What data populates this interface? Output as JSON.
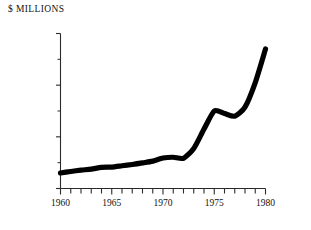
{
  "chart_data": {
    "type": "line",
    "title": "$ MILLIONS",
    "xlabel": "",
    "ylabel": "$ MILLIONS",
    "xlim": [
      1960,
      1980
    ],
    "ylim": [
      0,
      60000
    ],
    "grid": false,
    "legend": null,
    "x": [
      1960,
      1961,
      1962,
      1963,
      1964,
      1965,
      1966,
      1967,
      1968,
      1969,
      1970,
      1971,
      1972,
      1973,
      1974,
      1975,
      1976,
      1977,
      1978,
      1979,
      1980
    ],
    "values": [
      6000,
      6600,
      7100,
      7500,
      8200,
      8300,
      8800,
      9300,
      9900,
      10600,
      11800,
      12100,
      11700,
      15500,
      23000,
      30000,
      29000,
      28000,
      31500,
      41000,
      54000
    ],
    "series": [
      {
        "name": "value",
        "values": [
          6000,
          6600,
          7100,
          7500,
          8200,
          8300,
          8800,
          9300,
          9900,
          10600,
          11800,
          12100,
          11700,
          15500,
          23000,
          30000,
          29000,
          28000,
          31500,
          41000,
          54000
        ]
      }
    ],
    "y_major_ticks": [
      0,
      20000,
      40000,
      60000
    ],
    "y_major_tick_labels": [
      "0",
      "20,000",
      "40,000",
      "60,000"
    ],
    "y_minor_ticks": [
      10000,
      30000,
      50000
    ],
    "x_major_ticks": [
      1960,
      1965,
      1970,
      1975,
      1980
    ],
    "x_major_tick_labels": [
      "1960",
      "1965",
      "1970",
      "1975",
      "1980"
    ],
    "x_minor_ticks": [
      1961,
      1962,
      1963,
      1964,
      1966,
      1967,
      1968,
      1969,
      1971,
      1972,
      1973,
      1974,
      1976,
      1977,
      1978,
      1979
    ],
    "line_color": "#000000",
    "axis_color": "#2b2b2b",
    "background_color": "#ffffff"
  }
}
